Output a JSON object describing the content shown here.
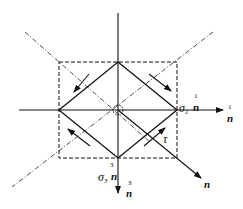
{
  "diagram": {
    "title": "",
    "colors": {
      "stroke": "#111111",
      "background": "#ffffff"
    },
    "labels": {
      "sigma1": "σ",
      "sigma1_sub": "1",
      "sigma3": "σ",
      "sigma3_sub": "3",
      "tau": "τ",
      "n": "n",
      "sup1": "1",
      "sup3": "3"
    },
    "elements": [
      "horizontal axis (n¹ direction)",
      "vertical axis (n³ direction)",
      "dashed square",
      "solid diamond",
      "dash-dot diagonals",
      "diagonal vector n",
      "four shear arrows",
      "central angle marker"
    ]
  }
}
